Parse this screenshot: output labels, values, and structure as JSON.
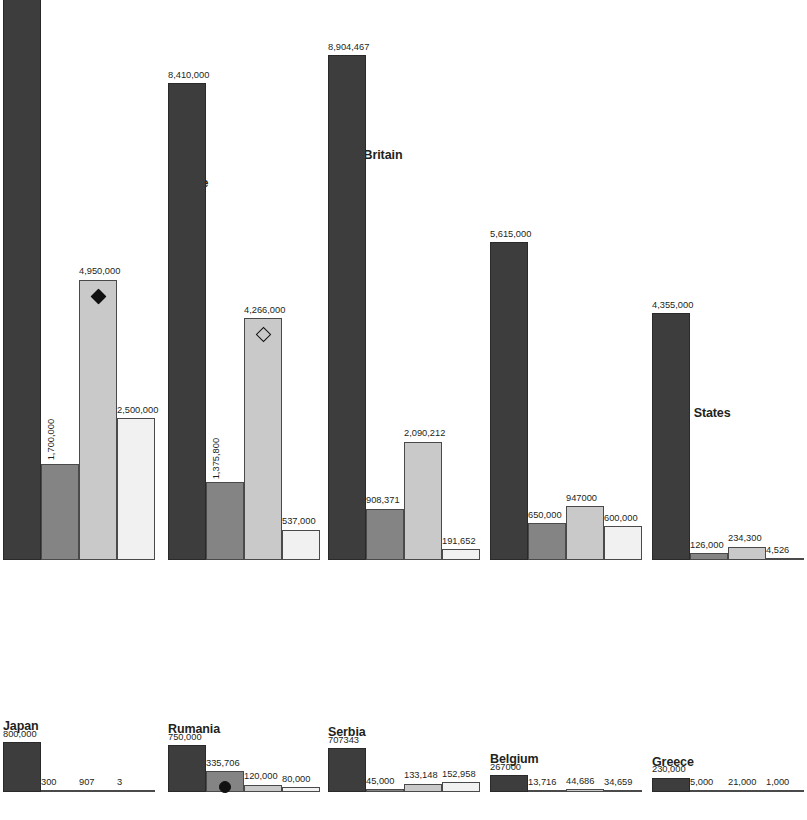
{
  "chart_data": {
    "type": "bar",
    "title": "",
    "subtitle": "",
    "xlabel": "",
    "ylabel": "",
    "grid": false,
    "legend_position": "none",
    "orientation": "vertical",
    "grouping": "grouped",
    "series": [
      {
        "name": "series-1",
        "color": "#3d3d3d"
      },
      {
        "name": "series-2",
        "color": "#848484"
      },
      {
        "name": "series-3",
        "color": "#c9c9c9"
      },
      {
        "name": "series-4",
        "color": "#f1f1f1"
      }
    ],
    "categories": [
      "Russia",
      "France",
      "Great Britain",
      "Italy",
      "United States",
      "Japan",
      "Rumania",
      "Serbia",
      "Belgium",
      "Greece"
    ],
    "ylim": [
      0,
      12000000
    ],
    "value_scale_per_row": [
      12000000,
      800000
    ],
    "groups": [
      {
        "name": "",
        "title_visible": false,
        "row": 0,
        "values": [
          12000000,
          1700000,
          4950000,
          2500000
        ],
        "labels": [
          "12,000,000",
          "1,700,000",
          "4,950,000",
          "2,500,000"
        ],
        "label_styles": [
          "above",
          "rot",
          "above",
          "above"
        ],
        "markers": [
          null,
          null,
          "diamond-filled",
          null
        ]
      },
      {
        "name": "France",
        "title_visible": true,
        "row": 0,
        "values": [
          8410000,
          1375800,
          4266000,
          537000
        ],
        "labels": [
          "8,410,000",
          "1,375,800",
          "4,266,000",
          "537,000"
        ],
        "label_styles": [
          "above",
          "rot",
          "above",
          "above"
        ],
        "markers": [
          null,
          null,
          "diamond-open",
          null
        ]
      },
      {
        "name": "Great Britain",
        "title_visible": true,
        "row": 0,
        "values": [
          8904467,
          908371,
          2090212,
          191652
        ],
        "labels": [
          "8,904,467",
          "908,371",
          "2,090,212",
          "191,652"
        ],
        "label_styles": [
          "above",
          "above",
          "above",
          "above"
        ],
        "markers": [
          null,
          null,
          null,
          null
        ]
      },
      {
        "name": "Italy",
        "title_visible": true,
        "row": 0,
        "values": [
          5615000,
          650000,
          947000,
          600000
        ],
        "labels": [
          "5,615,000",
          "650,000",
          "947000",
          "600,000"
        ],
        "label_styles": [
          "above",
          "above",
          "above",
          "above"
        ],
        "markers": [
          null,
          null,
          null,
          null
        ]
      },
      {
        "name": "United States",
        "title_visible": true,
        "row": 0,
        "values": [
          4355000,
          126000,
          234300,
          4526
        ],
        "labels": [
          "4,355,000",
          "126,000",
          "234,300",
          "4,526"
        ],
        "label_styles": [
          "above",
          "above",
          "above",
          "above"
        ],
        "markers": [
          null,
          null,
          null,
          null
        ]
      },
      {
        "name": "Japan",
        "title_visible": true,
        "row": 1,
        "values": [
          800000,
          300,
          907,
          3
        ],
        "labels": [
          "800,000",
          "300",
          "907",
          "3"
        ],
        "label_styles": [
          "above",
          "above",
          "above",
          "above"
        ],
        "markers": [
          null,
          null,
          null,
          null
        ]
      },
      {
        "name": "Rumania",
        "title_visible": true,
        "row": 1,
        "values": [
          750000,
          335706,
          120000,
          80000
        ],
        "labels": [
          "750,000",
          "335,706",
          "120,000",
          "80,000"
        ],
        "label_styles": [
          "above",
          "above",
          "above",
          "above"
        ],
        "markers": [
          null,
          "circle",
          null,
          null
        ]
      },
      {
        "name": "Serbia",
        "title_visible": true,
        "row": 1,
        "values": [
          707343,
          45000,
          133148,
          152958
        ],
        "labels": [
          "707343",
          "45,000",
          "133,148",
          "152,958"
        ],
        "label_styles": [
          "above",
          "above",
          "above",
          "above"
        ],
        "markers": [
          null,
          null,
          null,
          null
        ]
      },
      {
        "name": "Belgium",
        "title_visible": true,
        "row": 1,
        "values": [
          267000,
          13716,
          44686,
          34659
        ],
        "labels": [
          "267000",
          "13,716",
          "44,686",
          "34,659"
        ],
        "label_styles": [
          "above",
          "above",
          "above",
          "above"
        ],
        "markers": [
          null,
          null,
          null,
          null
        ]
      },
      {
        "name": "Greece",
        "title_visible": true,
        "row": 1,
        "values": [
          230000,
          5000,
          21000,
          1000
        ],
        "labels": [
          "230,000",
          "5,000",
          "21,000",
          "1,000"
        ],
        "label_styles": [
          "above",
          "above",
          "above",
          "above"
        ],
        "markers": [
          null,
          null,
          null,
          null
        ]
      }
    ]
  },
  "layout": {
    "rows": [
      {
        "baseline": 690,
        "max_height": 680,
        "max_value": 12000000
      },
      {
        "baseline": 806,
        "max_height": 50,
        "max_value": 800000
      }
    ],
    "group_x": [
      3,
      168,
      328,
      490,
      652,
      3,
      168,
      328,
      490,
      652
    ],
    "group_width": 153,
    "bar_width": 38
  }
}
